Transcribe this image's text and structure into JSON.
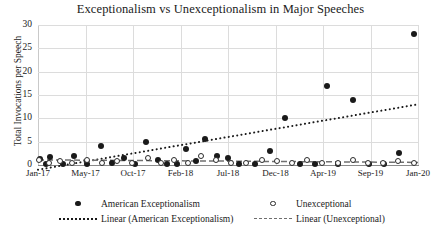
{
  "chart_data": {
    "type": "scatter",
    "title": "Exceptionalism vs Unexceptionalism in Major Speeches",
    "xlabel": "",
    "ylabel": "Total Invocations per Speech",
    "ylim": [
      0,
      30
    ],
    "yticks": [
      0,
      5,
      10,
      15,
      20,
      25,
      30
    ],
    "xticks": [
      "Jan-17",
      "May-17",
      "Oct-17",
      "Feb-18",
      "Jul-18",
      "Dec-18",
      "Apr-19",
      "Sep-19",
      "Jan-20"
    ],
    "grid": true,
    "legend_position": "bottom",
    "series": [
      {
        "name": "American Exceptionalism",
        "marker": "filled-circle",
        "x": [
          0.5,
          2.0,
          3.2,
          6.5,
          9.5,
          13.0,
          16.5,
          19.5,
          22.5,
          25.5,
          28.5,
          31.5,
          34.0,
          36.5,
          39.0,
          41.5,
          44.0,
          47.0,
          50.0,
          53.0,
          57.0,
          61.0,
          65.0,
          69.0,
          73.0,
          76.0,
          79.0,
          83.0,
          87.0,
          91.0,
          95.0,
          99.0
        ],
        "values": [
          1.2,
          0.2,
          1.8,
          0.3,
          2.0,
          0.2,
          4.0,
          0.4,
          1.5,
          0.2,
          5.0,
          1.0,
          0.3,
          0.2,
          3.5,
          0.8,
          5.5,
          2.0,
          1.6,
          0.2,
          0.3,
          3.0,
          10.0,
          0.3,
          0.2,
          17.0,
          0.2,
          14.0,
          0.3,
          0.2,
          2.5,
          28.0
        ]
      },
      {
        "name": "Unexceptional",
        "marker": "open-circle",
        "x": [
          0.5,
          3.0,
          6.0,
          9.0,
          13.0,
          17.0,
          21.0,
          25.0,
          29.0,
          32.5,
          36.0,
          39.5,
          43.0,
          47.0,
          51.0,
          55.0,
          59.0,
          63.0,
          67.0,
          71.0,
          75.0,
          79.0,
          83.0,
          87.0,
          91.0,
          95.0,
          99.0
        ],
        "values": [
          0.9,
          0.2,
          0.8,
          0.3,
          0.9,
          0.2,
          0.7,
          0.2,
          1.4,
          0.3,
          1.0,
          0.3,
          1.7,
          0.9,
          0.3,
          0.2,
          1.0,
          0.8,
          0.3,
          0.9,
          0.2,
          0.3,
          0.9,
          0.3,
          0.2,
          0.8,
          0.3
        ]
      }
    ],
    "trendlines": [
      {
        "name": "Linear (American Exceptionalism)",
        "style": "dotted",
        "x_start": 0,
        "y_start": -1.0,
        "x_end": 100,
        "y_end": 13.0
      },
      {
        "name": "Linear (Unexceptional)",
        "style": "dashed",
        "x_start": 0,
        "y_start": 1.1,
        "x_end": 100,
        "y_end": 0.55
      }
    ]
  },
  "legend": {
    "entries": [
      {
        "label": "American Exceptionalism",
        "key": "filled-circle"
      },
      {
        "label": "Unexceptional",
        "key": "open-circle"
      },
      {
        "label": "Linear (American Exceptionalism)",
        "key": "dotted-line"
      },
      {
        "label": "Linear (Unexceptional)",
        "key": "dashed-line"
      }
    ]
  }
}
